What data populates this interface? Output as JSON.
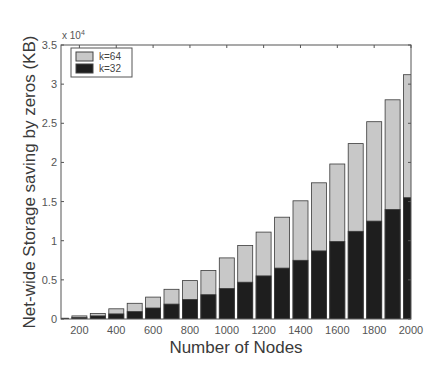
{
  "chart_data": {
    "type": "bar",
    "stacked": false,
    "overlaid": true,
    "title": "",
    "xlabel": "Number of Nodes",
    "ylabel": "Net-wide Storage saving by zeros (KB)",
    "y_multiplier": "x 10^4",
    "y_multiplier_base": "x 10",
    "y_multiplier_exp": "4",
    "xlim": [
      100,
      2000
    ],
    "ylim": [
      0,
      3.5
    ],
    "grid": false,
    "legend_position": "upper-left",
    "x": [
      100,
      200,
      300,
      400,
      500,
      600,
      700,
      800,
      900,
      1000,
      1100,
      1200,
      1300,
      1400,
      1500,
      1600,
      1700,
      1800,
      1900,
      2000
    ],
    "x_ticks": [
      200,
      400,
      600,
      800,
      1000,
      1200,
      1400,
      1600,
      1800,
      2000
    ],
    "x_tick_labels": [
      "200",
      "400",
      "600",
      "800",
      "1000",
      "1200",
      "1400",
      "1600",
      "1800",
      "2000"
    ],
    "y_ticks": [
      0,
      0.5,
      1,
      1.5,
      2,
      2.5,
      3,
      3.5
    ],
    "y_tick_labels": [
      "0",
      "0.5",
      "1",
      "1.5",
      "2",
      "2.5",
      "3",
      "3.5"
    ],
    "series": [
      {
        "name": "k=64",
        "color": "#c8c8c8",
        "values": [
          0.01,
          0.04,
          0.07,
          0.13,
          0.2,
          0.28,
          0.38,
          0.49,
          0.62,
          0.78,
          0.94,
          1.11,
          1.3,
          1.51,
          1.74,
          1.98,
          2.24,
          2.52,
          2.8,
          3.12
        ]
      },
      {
        "name": "k=32",
        "color": "#1e1e1e",
        "values": [
          0.005,
          0.02,
          0.04,
          0.065,
          0.095,
          0.14,
          0.19,
          0.25,
          0.31,
          0.39,
          0.47,
          0.55,
          0.65,
          0.75,
          0.87,
          0.99,
          1.12,
          1.25,
          1.4,
          1.55
        ]
      }
    ]
  },
  "legend": {
    "items": [
      {
        "label": "k=64",
        "color": "#c8c8c8"
      },
      {
        "label": "k=32",
        "color": "#1e1e1e"
      }
    ]
  }
}
